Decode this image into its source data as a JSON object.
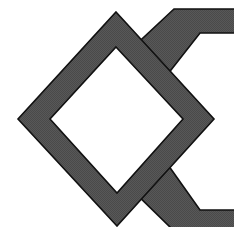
{
  "diagram": {
    "colors": {
      "background": "#ffffff",
      "fill": "#585858",
      "fill_dither": "#4a4a4a",
      "stroke": "#111111"
    },
    "shapes": {
      "diamond_frame": {
        "outer": "116,12 214,119 117,226 18,119",
        "inner": "116,47 183,119 117,193 50,119"
      },
      "upper_band": {
        "points": "174,9 236,9 236,33 200,33 160,84 128,52"
      },
      "lower_band": {
        "points": "128,186 161,155 200,210 236,210 236,229 172,229"
      }
    }
  }
}
